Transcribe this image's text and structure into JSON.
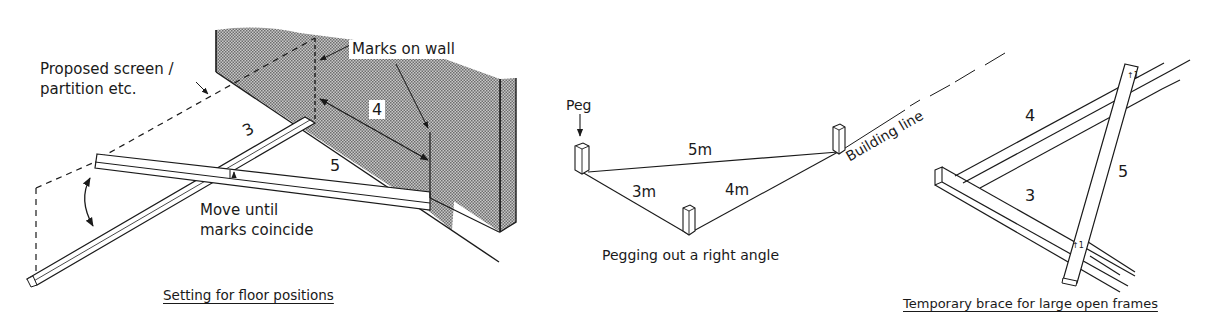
{
  "figures": [
    {
      "id": "floor",
      "caption": "Setting for floor positions",
      "labels": {
        "proposed_screen_line1": "Proposed screen /",
        "proposed_screen_line2": "partition etc.",
        "marks_on_wall": "Marks on wall",
        "move_until_line1": "Move until",
        "move_until_line2": "marks coincide",
        "side_3": "3",
        "side_4": "4",
        "side_5": "5"
      }
    },
    {
      "id": "pegging",
      "caption": "Pegging out a right angle",
      "labels": {
        "peg": "Peg",
        "side_5m": "5m",
        "side_3m": "3m",
        "side_4m": "4m",
        "building_line": "Building line"
      }
    },
    {
      "id": "brace",
      "caption": "Temporary brace for large open frames",
      "labels": {
        "side_4": "4",
        "side_5": "5",
        "side_3": "3"
      }
    }
  ],
  "colors": {
    "ink": "#1a1a1a",
    "wall_fill": "#9a9a9a"
  }
}
